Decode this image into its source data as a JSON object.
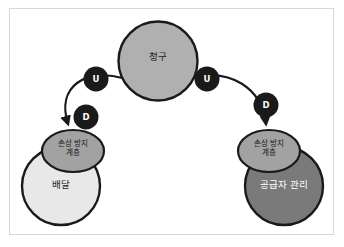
{
  "diagram": {
    "title": "",
    "background_color": "#ffffff",
    "frame_border_color": "#d8d8d8",
    "stroke_color": "#1a1a1a",
    "nodes": [
      {
        "id": "claim",
        "label": "청구",
        "shape": "circle",
        "cx": 158,
        "cy": 61,
        "r": 39.5,
        "fill": "#b0b0b0",
        "text_color": "#1c1c1c"
      },
      {
        "id": "layer-left",
        "label": "손상 방지\n계층",
        "shape": "ellipse",
        "cx": 73,
        "cy": 151,
        "rx": 31,
        "ry": 21,
        "fill": "#a2a2a2",
        "text_color": "#1a1a1a"
      },
      {
        "id": "delivery",
        "label": "배달",
        "shape": "circle",
        "cx": 61,
        "cy": 186,
        "r": 39,
        "fill": "#e8e8e8",
        "text_color": "#1c1c1c"
      },
      {
        "id": "layer-right",
        "label": "손상 방지\n계층",
        "shape": "ellipse",
        "cx": 269,
        "cy": 151,
        "rx": 31,
        "ry": 21,
        "fill": "#a2a2a2",
        "text_color": "#1a1a1a"
      },
      {
        "id": "supplier",
        "label": "공급자 관리",
        "shape": "circle",
        "cx": 284,
        "cy": 186,
        "r": 39,
        "fill": "#7a7a7a",
        "text_color": "#ffffff"
      }
    ],
    "edges": [
      {
        "id": "claim-to-delivery",
        "from": "claim",
        "to": "layer-left",
        "direction": "down-left",
        "arrowhead": true
      },
      {
        "id": "claim-to-supplier",
        "from": "claim",
        "to": "layer-right",
        "direction": "down-right",
        "arrowhead": true
      }
    ],
    "badges": [
      {
        "id": "badge-u-left",
        "label": "U",
        "cx": 96,
        "cy": 79,
        "r": 12.5,
        "fill": "#1a1a1a",
        "text_color": "#ffffff"
      },
      {
        "id": "badge-u-right",
        "label": "U",
        "cx": 207,
        "cy": 79,
        "r": 12.5,
        "fill": "#1a1a1a",
        "text_color": "#ffffff"
      },
      {
        "id": "badge-d-left",
        "label": "D",
        "cx": 86,
        "cy": 117,
        "r": 12.5,
        "fill": "#1a1a1a",
        "text_color": "#ffffff"
      },
      {
        "id": "badge-d-right",
        "label": "D",
        "cx": 266,
        "cy": 105,
        "r": 12.5,
        "fill": "#1a1a1a",
        "text_color": "#ffffff"
      }
    ]
  }
}
